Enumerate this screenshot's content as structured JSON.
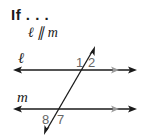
{
  "header": {
    "title": "If . . .",
    "condition": "ℓ ∥ m"
  },
  "diagram": {
    "lines": [
      {
        "name": "ℓ",
        "label": "ℓ",
        "y": 70,
        "parallel_marker": true
      },
      {
        "name": "m",
        "label": "m",
        "y": 109,
        "parallel_marker": true
      }
    ],
    "transversal": {
      "from": [
        44,
        135
      ],
      "to": [
        95,
        46
      ]
    },
    "angle_labels": [
      {
        "label": "1",
        "line": "ℓ",
        "position": "above-left"
      },
      {
        "label": "2",
        "line": "ℓ",
        "position": "above-right"
      },
      {
        "label": "8",
        "line": "m",
        "position": "below-left"
      },
      {
        "label": "7",
        "line": "m",
        "position": "below-right"
      }
    ],
    "colors": {
      "line": "#1a1a1a",
      "parallel_marker": "#9a9a9a",
      "angle_label": "#666666"
    }
  }
}
